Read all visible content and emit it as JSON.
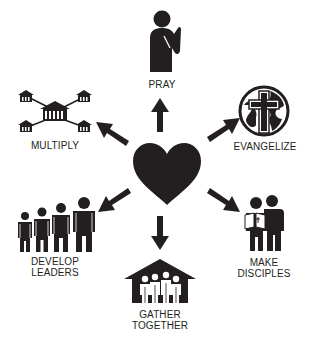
{
  "diagram": {
    "center": {
      "icon": "heart-icon",
      "color": "#231f20"
    },
    "nodes": [
      {
        "id": "pray",
        "label": "PRAY",
        "icon": "praying-person-icon"
      },
      {
        "id": "evangelize",
        "label": "EVANGELIZE",
        "icon": "globe-cross-icon"
      },
      {
        "id": "make_disciples",
        "label_line1": "MAKE",
        "label_line2": "DISCIPLES",
        "icon": "two-people-bible-icon"
      },
      {
        "id": "gather_together",
        "label_line1": "GATHER",
        "label_line2": "TOGETHER",
        "icon": "house-people-icon"
      },
      {
        "id": "develop_leaders",
        "label_line1": "DEVELOP",
        "label_line2": "LEADERS",
        "icon": "growing-people-icon"
      },
      {
        "id": "multiply",
        "label": "MULTIPLY",
        "icon": "house-network-icon"
      }
    ],
    "arrow_color": "#231f20"
  }
}
